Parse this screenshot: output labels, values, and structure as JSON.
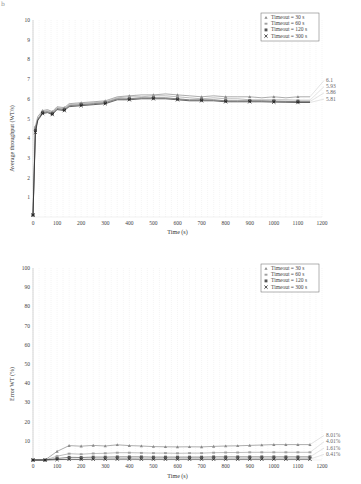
{
  "corner_mark": "b",
  "chart_data": [
    {
      "type": "line",
      "title": "",
      "xlabel": "Time (s)",
      "ylabel": "Average throughput (WT/s)",
      "xlim": [
        0,
        1200
      ],
      "ylim": [
        0,
        10
      ],
      "xticks": [
        0,
        100,
        200,
        300,
        400,
        500,
        600,
        700,
        800,
        900,
        1000,
        1100,
        1200
      ],
      "yticks": [
        1,
        2,
        3,
        4,
        5,
        6,
        7,
        8,
        9,
        10
      ],
      "grid": true,
      "legend_position": "upper right",
      "x": [
        0,
        10,
        20,
        40,
        60,
        80,
        100,
        130,
        150,
        200,
        250,
        300,
        350,
        400,
        450,
        500,
        550,
        600,
        650,
        700,
        750,
        800,
        850,
        900,
        950,
        1000,
        1050,
        1100,
        1150
      ],
      "series": [
        {
          "name": "Timeout = 30 s",
          "marker": "triangle",
          "color": "#8a8a8a",
          "end_label": "6.1",
          "values": [
            0.1,
            4.6,
            5.1,
            5.4,
            5.45,
            5.35,
            5.6,
            5.55,
            5.75,
            5.8,
            5.85,
            5.9,
            6.1,
            6.15,
            6.2,
            6.2,
            6.25,
            6.2,
            6.15,
            6.1,
            6.15,
            6.1,
            6.1,
            6.1,
            6.05,
            6.1,
            6.05,
            6.1,
            6.1
          ]
        },
        {
          "name": "Timeout = 60 s",
          "marker": "square",
          "color": "#a0a0a0",
          "end_label": "5.93",
          "values": [
            0.1,
            4.5,
            5.0,
            5.35,
            5.4,
            5.3,
            5.55,
            5.5,
            5.7,
            5.75,
            5.8,
            5.85,
            6.05,
            6.1,
            6.1,
            6.15,
            6.15,
            6.1,
            6.05,
            6.0,
            6.05,
            6.0,
            6.0,
            5.95,
            5.95,
            5.95,
            5.95,
            5.93,
            5.93
          ]
        },
        {
          "name": "Timeout = 120 s",
          "marker": "square-filled",
          "color": "#555555",
          "end_label": "5.86",
          "values": [
            0.1,
            4.4,
            4.95,
            5.3,
            5.35,
            5.25,
            5.5,
            5.45,
            5.65,
            5.7,
            5.75,
            5.8,
            6.0,
            6.0,
            6.05,
            6.05,
            6.05,
            6.0,
            5.95,
            5.95,
            5.95,
            5.9,
            5.9,
            5.9,
            5.9,
            5.88,
            5.87,
            5.86,
            5.86
          ]
        },
        {
          "name": "Timeout = 300 s",
          "marker": "x",
          "color": "#222222",
          "end_label": "5.81",
          "values": [
            0.1,
            4.3,
            4.9,
            5.25,
            5.3,
            5.2,
            5.45,
            5.4,
            5.6,
            5.65,
            5.7,
            5.75,
            5.95,
            5.95,
            6.0,
            6.0,
            6.0,
            5.95,
            5.9,
            5.9,
            5.9,
            5.85,
            5.85,
            5.85,
            5.85,
            5.83,
            5.82,
            5.81,
            5.81
          ]
        }
      ]
    },
    {
      "type": "line",
      "title": "",
      "xlabel": "Time (s)",
      "ylabel": "Error WT (%)",
      "xlim": [
        0,
        1200
      ],
      "ylim": [
        0,
        100
      ],
      "xticks": [
        0,
        100,
        200,
        300,
        400,
        500,
        600,
        700,
        800,
        900,
        1000,
        1100,
        1200
      ],
      "yticks": [
        10,
        20,
        30,
        40,
        50,
        60,
        70,
        80,
        90,
        100
      ],
      "grid": true,
      "legend_position": "upper right",
      "x": [
        0,
        50,
        100,
        150,
        200,
        250,
        300,
        350,
        400,
        450,
        500,
        550,
        600,
        650,
        700,
        750,
        800,
        850,
        900,
        950,
        1000,
        1050,
        1100,
        1150
      ],
      "series": [
        {
          "name": "Timeout = 30 s",
          "marker": "triangle",
          "color": "#8a8a8a",
          "end_label": "8.01%",
          "values": [
            0,
            0,
            4.5,
            7.5,
            7.2,
            7.6,
            7.3,
            7.9,
            7.5,
            7.3,
            7.0,
            6.9,
            6.8,
            6.9,
            6.8,
            7.1,
            7.3,
            7.4,
            7.6,
            7.8,
            8.0,
            8.0,
            8.0,
            8.01
          ]
        },
        {
          "name": "Timeout = 60 s",
          "marker": "square",
          "color": "#a0a0a0",
          "end_label": "4.01%",
          "values": [
            0,
            0,
            2.0,
            3.3,
            3.0,
            3.4,
            3.5,
            3.8,
            3.8,
            3.7,
            3.6,
            3.6,
            3.5,
            3.6,
            3.6,
            3.8,
            3.9,
            3.9,
            4.0,
            4.0,
            4.0,
            4.0,
            4.0,
            4.01
          ]
        },
        {
          "name": "Timeout = 120 s",
          "marker": "square-filled",
          "color": "#555555",
          "end_label": "1.61%",
          "values": [
            0,
            0,
            0.8,
            1.4,
            1.3,
            1.5,
            1.5,
            1.6,
            1.6,
            1.6,
            1.5,
            1.5,
            1.5,
            1.5,
            1.5,
            1.6,
            1.6,
            1.6,
            1.6,
            1.6,
            1.6,
            1.6,
            1.6,
            1.61
          ]
        },
        {
          "name": "Timeout = 300 s",
          "marker": "x",
          "color": "#222222",
          "end_label": "0.41%",
          "values": [
            0,
            0,
            0.2,
            0.35,
            0.3,
            0.4,
            0.4,
            0.45,
            0.45,
            0.4,
            0.4,
            0.4,
            0.4,
            0.4,
            0.4,
            0.4,
            0.4,
            0.41,
            0.41,
            0.41,
            0.41,
            0.41,
            0.41,
            0.41
          ]
        }
      ]
    }
  ]
}
